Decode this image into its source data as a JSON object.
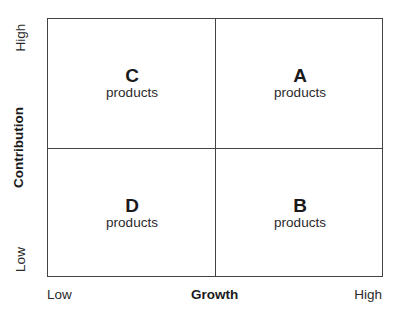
{
  "diagram": {
    "type": "2x2 matrix",
    "y_axis": {
      "title": "Contribution",
      "low": "Low",
      "high": "High"
    },
    "x_axis": {
      "title": "Growth",
      "low": "Low",
      "high": "High"
    },
    "quadrants": {
      "top_left": {
        "letter": "C",
        "label": "products"
      },
      "top_right": {
        "letter": "A",
        "label": "products"
      },
      "bottom_left": {
        "letter": "D",
        "label": "products"
      },
      "bottom_right": {
        "letter": "B",
        "label": "products"
      }
    }
  }
}
